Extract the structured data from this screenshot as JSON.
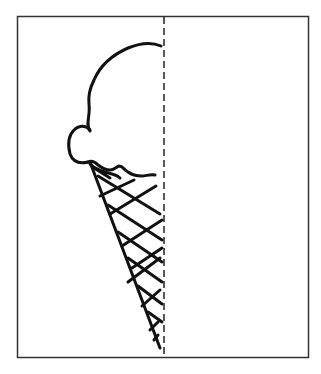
{
  "diagram": {
    "title": "Half ice cream cone with line of symmetry",
    "subject": "ice cream cone",
    "elements": [
      {
        "name": "frame",
        "type": "rectangle-border"
      },
      {
        "name": "symmetry-line",
        "type": "dashed-vertical-line"
      },
      {
        "name": "ice-cream-scoop",
        "type": "outline-half"
      },
      {
        "name": "waffle-cone",
        "type": "crosshatched-half-triangle"
      }
    ]
  },
  "style": {
    "stroke_color": "#111111",
    "border_color": "#333333",
    "background_color": "#ffffff"
  },
  "frame": {
    "x": 17,
    "y": 16,
    "width": 291,
    "height": 341
  },
  "symmetry_line": {
    "x": 164,
    "y1": 16,
    "y2": 357,
    "dash": "7 4"
  }
}
